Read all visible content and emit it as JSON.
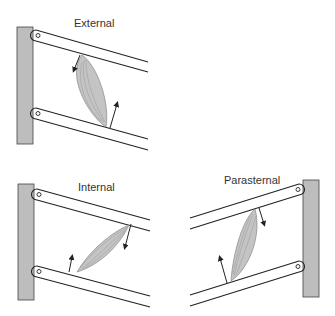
{
  "panels": [
    {
      "id": "external",
      "label": "External"
    },
    {
      "id": "internal",
      "label": "Internal"
    },
    {
      "id": "parasternal",
      "label": "Parasternal"
    }
  ],
  "colors": {
    "bar": "#bdbdbd",
    "line": "#222222",
    "muscle": "#c4c4c4"
  }
}
